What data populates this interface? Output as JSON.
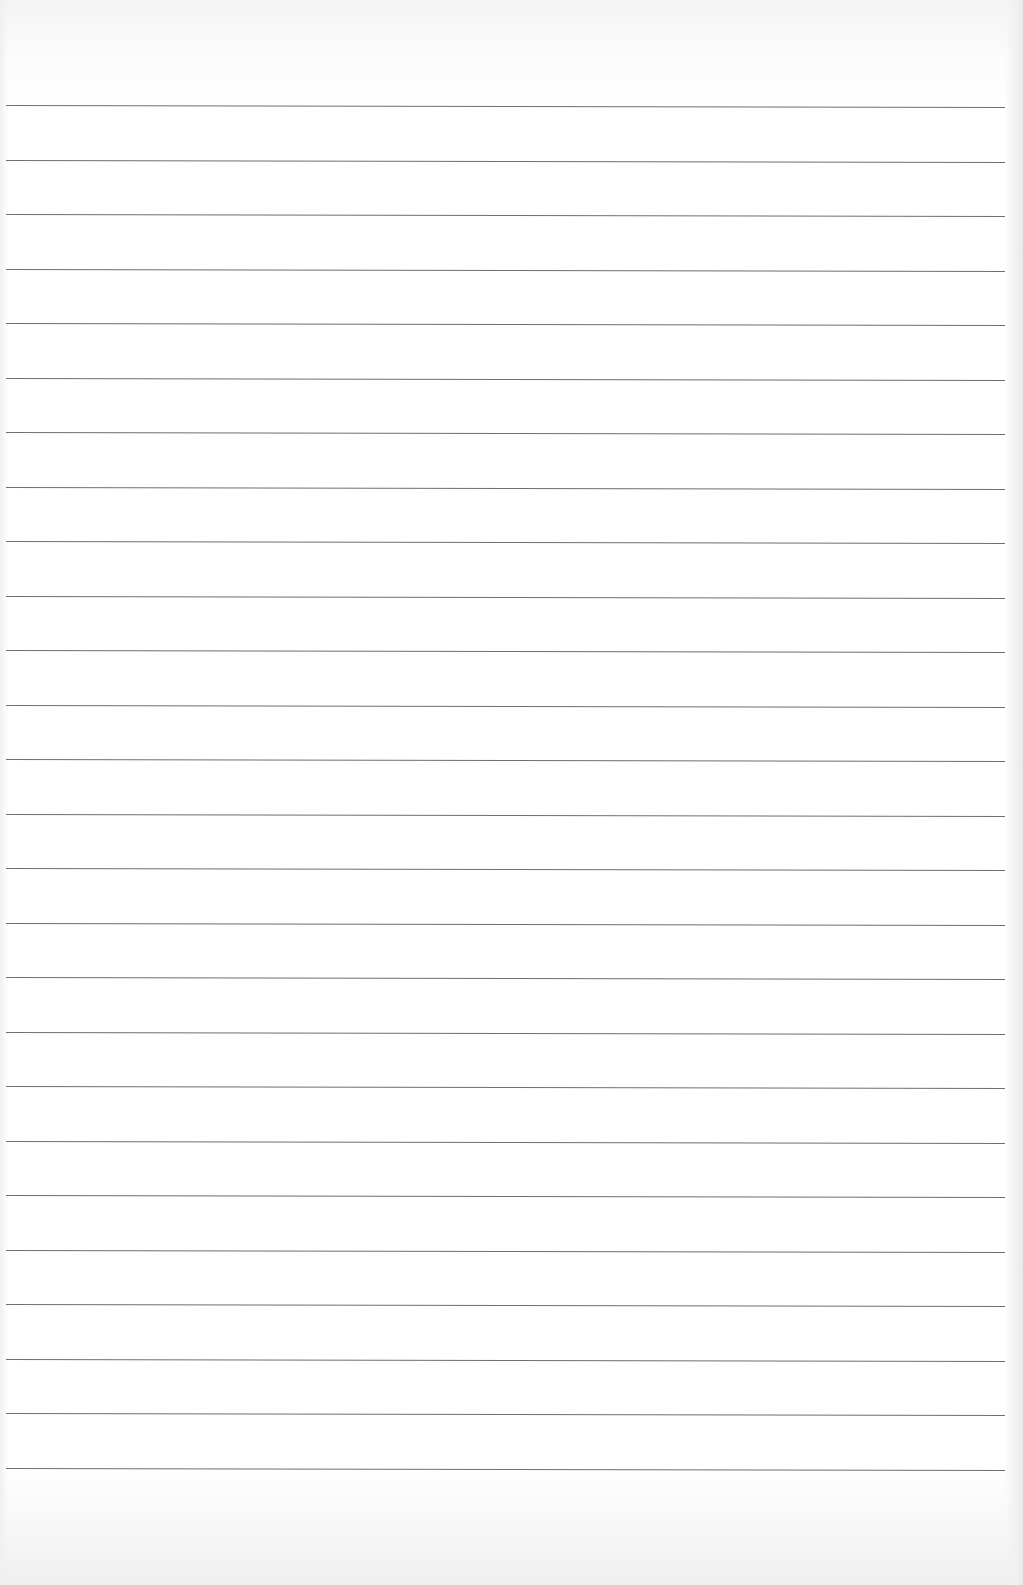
{
  "sheet": {
    "type": "ruled-paper",
    "background_color": "#ffffff",
    "line_color": "#6f6f6f",
    "line_count": 26,
    "first_line_y": 105,
    "line_spacing": 54.5,
    "line_left": 6,
    "line_width": 999,
    "text_content": ""
  }
}
